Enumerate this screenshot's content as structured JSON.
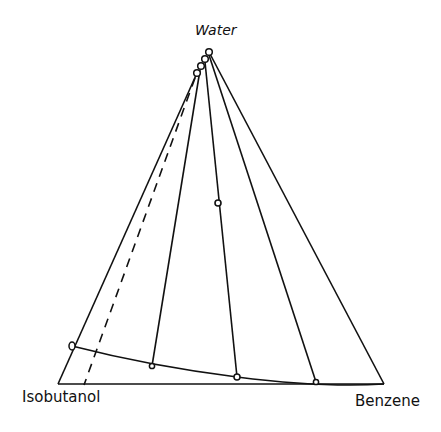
{
  "diagram": {
    "type": "ternary-phase-diagram",
    "vertices": {
      "top": {
        "label": "Water",
        "x": 210,
        "y": 50
      },
      "left": {
        "label": "Isobutanol",
        "x": 58,
        "y": 384
      },
      "right": {
        "label": "Benzene",
        "x": 384,
        "y": 384
      }
    },
    "labels": {
      "water": "Water",
      "isobutanol": "Isobutanol",
      "benzene": "Benzene"
    },
    "water_rich_points": [
      {
        "x": 197,
        "y": 73
      },
      {
        "x": 201,
        "y": 66
      },
      {
        "x": 205,
        "y": 59
      },
      {
        "x": 209,
        "y": 52
      }
    ],
    "organic_rich_points": [
      {
        "x": 72,
        "y": 346
      },
      {
        "x": 152,
        "y": 366
      },
      {
        "x": 237,
        "y": 377
      },
      {
        "x": 316,
        "y": 382
      }
    ],
    "tie_lines": [
      {
        "from": {
          "x": 200,
          "y": 70
        },
        "to": {
          "x": 152,
          "y": 366
        }
      },
      {
        "from": {
          "x": 205,
          "y": 62
        },
        "to": {
          "x": 237,
          "y": 377
        }
      },
      {
        "from": {
          "x": 209,
          "y": 55
        },
        "to": {
          "x": 316,
          "y": 382
        }
      }
    ],
    "dashed_line": {
      "from": {
        "x": 195,
        "y": 78
      },
      "to": {
        "x": 84,
        "y": 385
      }
    },
    "mixture_point": {
      "x": 218,
      "y": 203
    },
    "line_color": "#111111"
  }
}
